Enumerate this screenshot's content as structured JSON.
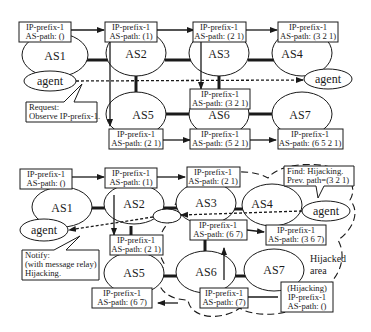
{
  "colors": {
    "ink": "#1a1a1a",
    "background": "#ffffff",
    "box_fill": "#ffffff"
  },
  "top_diagram": {
    "as_nodes": [
      {
        "id": "AS1",
        "label": "AS1"
      },
      {
        "id": "AS2",
        "label": "AS2"
      },
      {
        "id": "AS3",
        "label": "AS3"
      },
      {
        "id": "AS4",
        "label": "AS4"
      },
      {
        "id": "AS5",
        "label": "AS5"
      },
      {
        "id": "AS6",
        "label": "AS6"
      },
      {
        "id": "AS7",
        "label": "AS7"
      }
    ],
    "agents": [
      {
        "label": "agent"
      },
      {
        "label": "agent"
      }
    ],
    "route_boxes": [
      {
        "line1": "IP-prefix-1",
        "line2": "AS-path: ()"
      },
      {
        "line1": "IP-prefix-1",
        "line2": "AS-path: (1)"
      },
      {
        "line1": "IP-prefix-1",
        "line2": "AS-path: (2 1)"
      },
      {
        "line1": "IP-prefix-1",
        "line2": "AS-path: (3 2 1)"
      },
      {
        "line1": "IP-prefix-1",
        "line2": "AS-path: (3 2 1)"
      },
      {
        "line1": "IP-prefix-1",
        "line2": "AS-path: (2 1)"
      },
      {
        "line1": "IP-prefix-1",
        "line2": "AS-path: (5 2 1)"
      },
      {
        "line1": "IP-prefix-1",
        "line2": "AS-path: (6 5 2 1)"
      }
    ],
    "callout": {
      "line1": "Request:",
      "line2": "Observe IP-prefix-1."
    }
  },
  "bottom_diagram": {
    "as_nodes": [
      {
        "id": "AS1",
        "label": "AS1"
      },
      {
        "id": "AS2",
        "label": "AS2"
      },
      {
        "id": "AS3",
        "label": "AS3"
      },
      {
        "id": "AS4",
        "label": "AS4"
      },
      {
        "id": "AS5",
        "label": "AS5"
      },
      {
        "id": "AS6",
        "label": "AS6"
      },
      {
        "id": "AS7",
        "label": "AS7"
      }
    ],
    "agents": [
      {
        "label": "agent"
      },
      {
        "label": "agent"
      }
    ],
    "route_boxes": [
      {
        "line1": "IP-prefix-1",
        "line2": "AS-path: ()"
      },
      {
        "line1": "IP-prefix-1",
        "line2": "AS-path: (1)"
      },
      {
        "line1": "IP-prefix-1",
        "line2": "AS-path: (2 1)"
      },
      {
        "line1": "IP-prefix-1",
        "line2": "AS-path: (2 1)"
      },
      {
        "line1": "IP-prefix-1",
        "line2": "AS-path: (6 7)"
      },
      {
        "line1": "IP-prefix-1",
        "line2": "AS-path: (3 6 7)"
      },
      {
        "line1": "IP-prefix-1",
        "line2": "AS-path: (6 7)"
      },
      {
        "line1": "IP-prefix-1",
        "line2": "AS-path: (7)"
      }
    ],
    "hijack_box": {
      "line1": "(Hijacking)",
      "line2": "IP-prefix-1",
      "line3": "AS-path: ()"
    },
    "find_callout": {
      "line1": "Find: Hijacking.",
      "line2": "Prev. path=(3 2 1)"
    },
    "notify_callout": {
      "line1": "Notify:",
      "line2": "(with message relay)",
      "line3": "Hijacking."
    },
    "hijacked_area": {
      "line1": "Hijacked",
      "line2": "area"
    }
  }
}
